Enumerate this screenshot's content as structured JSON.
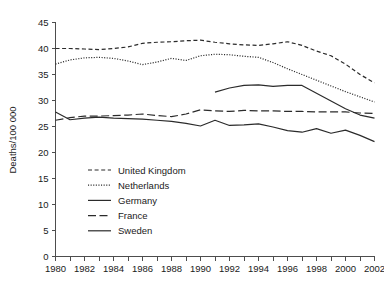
{
  "chart_data": {
    "type": "line",
    "title": "",
    "xlabel": "",
    "ylabel": "Deaths/100 000",
    "xlim": [
      1980,
      2002
    ],
    "ylim": [
      0,
      45
    ],
    "ytick_step": 5,
    "xtick_step": 1,
    "xtick_label_step": 2,
    "grid": false,
    "legend_position": "inside-lower-left",
    "x": [
      1980,
      1981,
      1982,
      1983,
      1984,
      1985,
      1986,
      1987,
      1988,
      1989,
      1990,
      1991,
      1992,
      1993,
      1994,
      1995,
      1996,
      1997,
      1998,
      1999,
      2000,
      2001,
      2002
    ],
    "xtick_labels": [
      "1980",
      "1982",
      "1984",
      "1986",
      "1988",
      "1990",
      "1992",
      "1994",
      "1996",
      "1998",
      "2000",
      "2002"
    ],
    "ytick_labels": [
      "0",
      "5",
      "10",
      "15",
      "20",
      "25",
      "30",
      "35",
      "40",
      "45"
    ],
    "series": [
      {
        "name": "United Kingdom",
        "style": "dashed",
        "color": "#2b2b2b",
        "x": [
          1980,
          1981,
          1982,
          1983,
          1984,
          1985,
          1986,
          1987,
          1988,
          1989,
          1990,
          1991,
          1992,
          1993,
          1994,
          1995,
          1996,
          1997,
          1998,
          1999,
          2000,
          2001,
          2002
        ],
        "values": [
          40.0,
          40.0,
          39.9,
          39.8,
          40.0,
          40.3,
          41.0,
          41.2,
          41.3,
          41.5,
          41.6,
          41.2,
          40.9,
          40.7,
          40.6,
          40.9,
          41.3,
          40.6,
          39.5,
          38.6,
          37.0,
          35.0,
          33.4
        ]
      },
      {
        "name": "Netherlands",
        "style": "dotted",
        "color": "#2b2b2b",
        "x": [
          1980,
          1981,
          1982,
          1983,
          1984,
          1985,
          1986,
          1987,
          1988,
          1989,
          1990,
          1991,
          1992,
          1993,
          1994,
          1995,
          1996,
          1997,
          1998,
          1999,
          2000,
          2001,
          2002
        ],
        "values": [
          37.0,
          37.8,
          38.2,
          38.3,
          38.1,
          37.6,
          36.9,
          37.4,
          38.1,
          37.7,
          38.6,
          38.9,
          38.8,
          38.5,
          38.3,
          37.3,
          36.1,
          35.0,
          33.9,
          32.8,
          31.7,
          30.7,
          29.7
        ]
      },
      {
        "name": "Germany",
        "style": "solid-thin",
        "color": "#2b2b2b",
        "x": [
          1991,
          1992,
          1993,
          1994,
          1995,
          1996,
          1997,
          1998,
          1999,
          2000,
          2001,
          2002
        ],
        "values": [
          31.6,
          32.4,
          32.9,
          33.0,
          32.7,
          32.9,
          32.9,
          31.4,
          29.9,
          28.4,
          27.2,
          26.6
        ]
      },
      {
        "name": "France",
        "style": "long-dash",
        "color": "#2b2b2b",
        "x": [
          1980,
          1981,
          1982,
          1983,
          1984,
          1985,
          1986,
          1987,
          1988,
          1989,
          1990,
          1991,
          1992,
          1993,
          1994,
          1995,
          1996,
          1997,
          1998,
          1999,
          2000,
          2001,
          2002
        ],
        "values": [
          26.2,
          26.7,
          27.0,
          27.0,
          27.1,
          27.2,
          27.4,
          27.1,
          26.9,
          27.4,
          28.2,
          28.0,
          27.9,
          28.1,
          28.0,
          28.0,
          27.9,
          27.9,
          27.8,
          27.8,
          27.8,
          27.6,
          27.5
        ]
      },
      {
        "name": "Sweden",
        "style": "solid",
        "color": "#2b2b2b",
        "x": [
          1980,
          1981,
          1982,
          1983,
          1984,
          1985,
          1986,
          1987,
          1988,
          1989,
          1990,
          1991,
          1992,
          1993,
          1994,
          1995,
          1996,
          1997,
          1998,
          1999,
          2000,
          2001,
          2002
        ],
        "values": [
          27.8,
          26.3,
          26.6,
          26.8,
          26.6,
          26.5,
          26.4,
          26.2,
          26.0,
          25.6,
          25.1,
          26.2,
          25.2,
          25.3,
          25.5,
          24.9,
          24.2,
          23.9,
          24.6,
          23.7,
          24.3,
          23.3,
          22.1
        ]
      }
    ],
    "legend_entries": [
      {
        "label": "United Kingdom",
        "style": "dashed"
      },
      {
        "label": "Netherlands",
        "style": "dotted"
      },
      {
        "label": "Germany",
        "style": "solid-thin"
      },
      {
        "label": "France",
        "style": "long-dash"
      },
      {
        "label": "Sweden",
        "style": "solid"
      }
    ]
  }
}
